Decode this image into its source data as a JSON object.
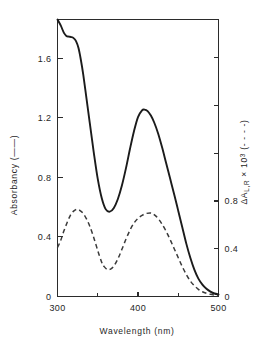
{
  "figure": {
    "background_color": "#ffffff",
    "ink_color": "#1b1b1b"
  },
  "chart_data": {
    "type": "line",
    "title": "",
    "subtitle": "",
    "xlabel": "Wavelength (nm)",
    "ylabel": "Absorbancy (——)",
    "y2label": "ΔA",
    "y2label_sub": "L,R",
    "y2label_mid": " × 10",
    "y2label_sup": "3",
    "y2label_tail": " (- - - -)",
    "xlim": [
      300,
      500
    ],
    "ylim": [
      0,
      1.86
    ],
    "y2lim": [
      0,
      2.32
    ],
    "grid": false,
    "legend_position": "axis-labels",
    "x_ticks_major": [
      300,
      400,
      500
    ],
    "x_ticks_major_labels": [
      "300",
      "400",
      "500"
    ],
    "x_ticks_minor": [
      350,
      450
    ],
    "y_ticks_major": [
      0,
      0.4,
      0.8,
      1.2,
      1.6
    ],
    "y_ticks_major_labels": [
      "0",
      "0.4",
      "0.8",
      "1.2",
      "1.6"
    ],
    "y2_ticks_major": [
      0,
      0.4,
      0.8
    ],
    "y2_ticks_major_labels": [
      "0",
      "0.4",
      "0.8"
    ],
    "y2_ticks_unlabeled": [
      1.2,
      1.6,
      2.0
    ],
    "series": [
      {
        "name": "Absorbancy",
        "style": "solid",
        "axis": "left",
        "color": "#1b1b1b",
        "x": [
          300,
          304,
          308,
          311,
          314,
          317,
          320,
          323,
          326,
          329,
          332,
          336,
          340,
          345,
          350,
          355,
          360,
          365,
          370,
          375,
          380,
          385,
          390,
          395,
          400,
          405,
          408,
          412,
          416,
          420,
          425,
          430,
          435,
          440,
          445,
          450,
          455,
          460,
          465,
          470,
          475,
          480,
          485,
          490,
          495,
          500
        ],
        "y": [
          1.86,
          1.82,
          1.77,
          1.75,
          1.745,
          1.742,
          1.735,
          1.715,
          1.67,
          1.59,
          1.49,
          1.33,
          1.17,
          0.97,
          0.79,
          0.66,
          0.585,
          0.57,
          0.595,
          0.655,
          0.745,
          0.86,
          0.99,
          1.11,
          1.205,
          1.25,
          1.255,
          1.245,
          1.215,
          1.17,
          1.095,
          1.0,
          0.895,
          0.79,
          0.685,
          0.575,
          0.465,
          0.355,
          0.26,
          0.18,
          0.12,
          0.08,
          0.052,
          0.033,
          0.02,
          0.014
        ]
      },
      {
        "name": "ΔA L,R × 10³",
        "style": "dashed",
        "axis": "right",
        "color": "#3a3a3a",
        "x": [
          300,
          304,
          308,
          312,
          316,
          320,
          324,
          328,
          332,
          336,
          340,
          345,
          350,
          355,
          358,
          362,
          366,
          370,
          375,
          380,
          385,
          390,
          395,
          400,
          405,
          410,
          415,
          418,
          422,
          426,
          430,
          435,
          440,
          445,
          450,
          455,
          460,
          465,
          470,
          475,
          480,
          485,
          490,
          495,
          500
        ],
        "y": [
          0.41,
          0.47,
          0.55,
          0.62,
          0.68,
          0.715,
          0.73,
          0.72,
          0.695,
          0.65,
          0.59,
          0.495,
          0.385,
          0.285,
          0.25,
          0.225,
          0.23,
          0.255,
          0.315,
          0.395,
          0.48,
          0.555,
          0.615,
          0.655,
          0.68,
          0.695,
          0.7,
          0.695,
          0.675,
          0.645,
          0.605,
          0.545,
          0.475,
          0.4,
          0.325,
          0.25,
          0.185,
          0.13,
          0.09,
          0.06,
          0.04,
          0.027,
          0.018,
          0.012,
          0.008
        ]
      }
    ],
    "annotations": [
      {
        "name": "solid-shoulder",
        "x": 318,
        "y_left": 1.74,
        "note": "shoulder"
      },
      {
        "name": "solid-minimum",
        "x": 365,
        "y_left": 0.57,
        "note": "trough"
      },
      {
        "name": "solid-peak",
        "x": 408,
        "y_left": 1.255,
        "note": "Soret band peak"
      },
      {
        "name": "dashed-peak-1",
        "x": 324,
        "y_right": 0.73,
        "note": "first CD extremum"
      },
      {
        "name": "dashed-minimum",
        "x": 362,
        "y_right": 0.225,
        "note": "CD trough"
      },
      {
        "name": "dashed-peak-2",
        "x": 415,
        "y_right": 0.7,
        "note": "second CD extremum"
      }
    ]
  }
}
